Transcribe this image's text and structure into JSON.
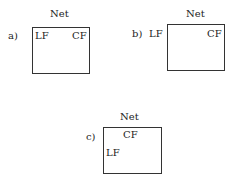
{
  "panels": [
    {
      "label": "a)",
      "title": "Net",
      "lf": "LF",
      "cf": "CF"
    },
    {
      "label": "b)",
      "title": "Net",
      "lf": "LF",
      "cf": "CF"
    },
    {
      "label": "c)",
      "title": "Net",
      "lf": "LF",
      "cf": "CF"
    }
  ]
}
